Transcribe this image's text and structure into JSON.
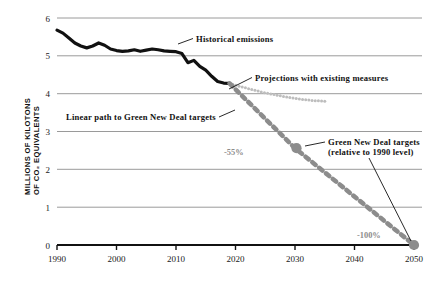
{
  "chart_data": {
    "type": "line",
    "title": "",
    "xlabel": "",
    "ylabel": "MILLIONS OF KILOTONS",
    "ylabel_line2": "OF CO₂ EQUIVALENTS",
    "xlim": [
      1990,
      2050
    ],
    "ylim": [
      0,
      6
    ],
    "grid": true,
    "xticks": [
      "1990",
      "2000",
      "2010",
      "2020",
      "2030",
      "2040",
      "2050"
    ],
    "xtick_values": [
      1990,
      2000,
      2010,
      2020,
      2030,
      2040,
      2050
    ],
    "yticks": [
      "0",
      "1",
      "2",
      "3",
      "4",
      "5",
      "6"
    ],
    "ytick_values": [
      0,
      1,
      2,
      3,
      4,
      5,
      6
    ],
    "legend_position": "inline-annotations",
    "series": [
      {
        "name": "Historical emissions",
        "style": "solid-black-thick",
        "color": "#111111",
        "x": [
          1990,
          1991,
          1992,
          1993,
          1994,
          1995,
          1996,
          1997,
          1998,
          1999,
          2000,
          2001,
          2002,
          2003,
          2004,
          2005,
          2006,
          2007,
          2008,
          2009,
          2010,
          2011,
          2012,
          2013,
          2014,
          2015,
          2016,
          2017,
          2018,
          2019
        ],
        "values": [
          5.68,
          5.6,
          5.47,
          5.34,
          5.26,
          5.21,
          5.26,
          5.34,
          5.28,
          5.18,
          5.14,
          5.12,
          5.13,
          5.16,
          5.12,
          5.15,
          5.18,
          5.16,
          5.13,
          5.12,
          5.11,
          5.06,
          4.82,
          4.88,
          4.72,
          4.62,
          4.46,
          4.32,
          4.28,
          4.27
        ]
      },
      {
        "name": "Projections with existing measures",
        "style": "dotted-light-gray",
        "color": "#bdbdbd",
        "x": [
          2019,
          2021,
          2023,
          2025,
          2027,
          2029,
          2031,
          2033,
          2035
        ],
        "values": [
          4.27,
          4.18,
          4.1,
          4.02,
          3.96,
          3.9,
          3.85,
          3.82,
          3.8
        ]
      },
      {
        "name": "Linear path to Green New Deal targets",
        "style": "dashed-gray-thick",
        "color": "#8c8c8c",
        "x": [
          2019,
          2030,
          2050
        ],
        "values": [
          4.27,
          2.56,
          0.0
        ]
      }
    ],
    "markers": [
      {
        "name": "target-2030",
        "x": 2030,
        "y": 2.56,
        "color": "#8c8c8c",
        "label": "-55%"
      },
      {
        "name": "target-2050",
        "x": 2050,
        "y": 0.0,
        "color": "#8c8c8c",
        "label": "-100%"
      }
    ],
    "annotations": [
      {
        "name": "historical-emissions-label",
        "text": "Historical emissions"
      },
      {
        "name": "projections-label",
        "text": "Projections with existing measures"
      },
      {
        "name": "linear-path-label",
        "text": "Linear path to Green New Deal targets"
      },
      {
        "name": "gnd-targets-label-line1",
        "text": "Green New Deal targets"
      },
      {
        "name": "gnd-targets-label-line2",
        "text": "(relative to 1990 level)"
      },
      {
        "name": "pct-2030-label",
        "text": "-55%"
      },
      {
        "name": "pct-2050-label",
        "text": "-100%"
      }
    ]
  },
  "colors": {
    "historical": "#111111",
    "projection": "#bdbdbd",
    "linear_path": "#8c8c8c",
    "gridline": "#9a9a9a",
    "axis": "#111111",
    "percent_text": "#8c8c8c"
  }
}
